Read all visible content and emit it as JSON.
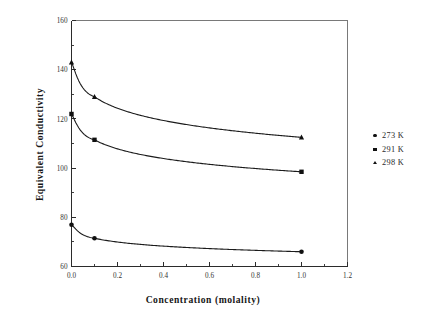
{
  "chart_data": {
    "type": "line",
    "title": "",
    "xlabel": "Concentration (molality)",
    "ylabel": "Equivalent  Conductivity",
    "xlim": [
      0.0,
      1.2
    ],
    "ylim": [
      60,
      160
    ],
    "grid": false,
    "legend_position": "right",
    "x_ticks": [
      "0.0",
      "0.2",
      "0.4",
      "0.6",
      "0.8",
      "1.0",
      "1.2"
    ],
    "x_tick_values": [
      0.0,
      0.2,
      0.4,
      0.6,
      0.8,
      1.0,
      1.2
    ],
    "x_minor_step": 0.1,
    "y_ticks": [
      "60",
      "80",
      "100",
      "120",
      "140",
      "160"
    ],
    "y_tick_values": [
      60,
      80,
      100,
      120,
      140,
      160
    ],
    "y_minor_step": 10,
    "x": [
      0.0,
      0.1,
      1.0
    ],
    "series": [
      {
        "name": "273 K",
        "marker": "circle",
        "values": [
          77.0,
          71.5,
          66.0
        ]
      },
      {
        "name": "291 K",
        "marker": "square",
        "values": [
          122.0,
          111.5,
          98.5
        ]
      },
      {
        "name": "298 K",
        "marker": "triangle",
        "values": [
          143.0,
          129.0,
          112.5
        ]
      }
    ],
    "colors": {
      "line": "#1b1b1b",
      "marker": "#101010",
      "axis": "#2b2b2b",
      "frame": "#6a6a6a",
      "background": "#ffffff"
    }
  },
  "legend": {
    "items": [
      {
        "label": "273 K",
        "marker": "circle"
      },
      {
        "label": "291 K",
        "marker": "square"
      },
      {
        "label": "298 K",
        "marker": "triangle"
      }
    ]
  },
  "axes": {
    "x_title": "Concentration (molality)",
    "y_title": "Equivalent  Conductivity"
  }
}
